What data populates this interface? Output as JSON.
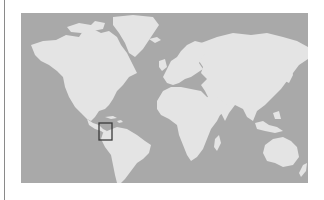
{
  "map": {
    "type": "world-locator-map",
    "projection": "mercator",
    "colors": {
      "ocean": "#a9a9a9",
      "land": "#e4e4e4",
      "locator_box": "#3a3a3a",
      "page_background": "#ffffff",
      "left_rule": "#8a8a8a"
    },
    "locator": {
      "highlighted_region": "Peru",
      "continent": "South America"
    }
  }
}
